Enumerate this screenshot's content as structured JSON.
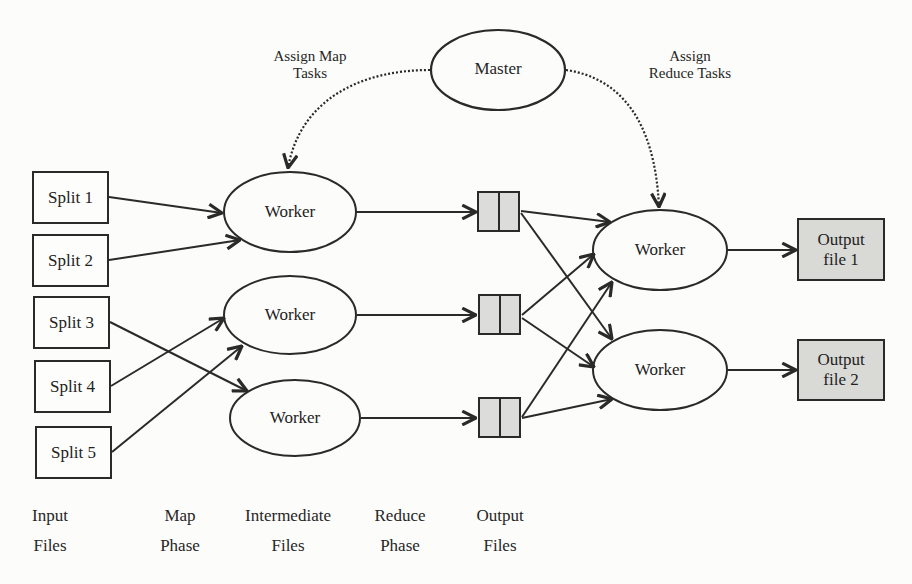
{
  "master": {
    "label": "Master",
    "assign_map_label_line1": "Assign Map",
    "assign_map_label_line2": "Tasks",
    "assign_reduce_label_line1": "Assign",
    "assign_reduce_label_line2": "Reduce Tasks"
  },
  "input_splits": [
    {
      "label": "Split 1"
    },
    {
      "label": "Split 2"
    },
    {
      "label": "Split 3"
    },
    {
      "label": "Split 4"
    },
    {
      "label": "Split 5"
    }
  ],
  "map_workers": [
    {
      "label": "Worker"
    },
    {
      "label": "Worker"
    },
    {
      "label": "Worker"
    }
  ],
  "reduce_workers": [
    {
      "label": "Worker"
    },
    {
      "label": "Worker"
    }
  ],
  "output_files": [
    {
      "line1": "Output",
      "line2": "file 1"
    },
    {
      "line1": "Output",
      "line2": "file 2"
    }
  ],
  "phases": [
    {
      "line1": "Input",
      "line2": "Files"
    },
    {
      "line1": "Map",
      "line2": "Phase"
    },
    {
      "line1": "Intermediate",
      "line2": "Files"
    },
    {
      "line1": "Reduce",
      "line2": "Phase"
    },
    {
      "line1": "Output",
      "line2": "Files"
    }
  ],
  "colors": {
    "stroke": "#2a2a2a",
    "file_fill": "#d9d9d6",
    "background": "#fcfcfa"
  },
  "edges": [
    {
      "from": "Split 1",
      "to": "Map Worker 1"
    },
    {
      "from": "Split 2",
      "to": "Map Worker 1"
    },
    {
      "from": "Split 3",
      "to": "Map Worker 3"
    },
    {
      "from": "Split 4",
      "to": "Map Worker 2"
    },
    {
      "from": "Split 5",
      "to": "Map Worker 2"
    },
    {
      "from": "Map Worker 1",
      "to": "Intermediate File 1"
    },
    {
      "from": "Map Worker 2",
      "to": "Intermediate File 2"
    },
    {
      "from": "Map Worker 3",
      "to": "Intermediate File 3"
    },
    {
      "from": "Intermediate File 1",
      "to": "Reduce Worker 1"
    },
    {
      "from": "Intermediate File 1",
      "to": "Reduce Worker 2"
    },
    {
      "from": "Intermediate File 2",
      "to": "Reduce Worker 1"
    },
    {
      "from": "Intermediate File 2",
      "to": "Reduce Worker 2"
    },
    {
      "from": "Intermediate File 3",
      "to": "Reduce Worker 1"
    },
    {
      "from": "Intermediate File 3",
      "to": "Reduce Worker 2"
    },
    {
      "from": "Reduce Worker 1",
      "to": "Output file 1"
    },
    {
      "from": "Reduce Worker 2",
      "to": "Output file 2"
    },
    {
      "from": "Master",
      "to": "Map Worker 1",
      "style": "dotted"
    },
    {
      "from": "Master",
      "to": "Reduce Worker 1",
      "style": "dotted"
    }
  ]
}
